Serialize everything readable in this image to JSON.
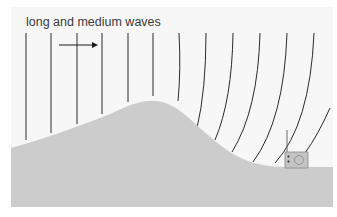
{
  "diagram": {
    "label": "long and medium waves",
    "direction_arrow": "propagation-direction",
    "colors": {
      "background": "#f7f7f7",
      "ground": "#cccccc",
      "wave_lines": "#2a2a2a",
      "radio_body": "#c4c4c4",
      "radio_outline": "#8a8a8a"
    },
    "elements": [
      "wavefronts",
      "hill",
      "radio-receiver"
    ]
  }
}
